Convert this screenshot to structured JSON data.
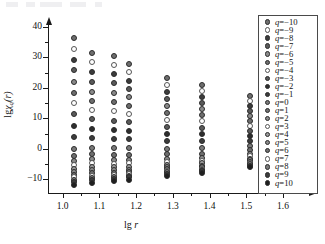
{
  "figure": {
    "background": "#ffffff",
    "axis_color": "#1a1a1a"
  },
  "chart_data": {
    "type": "scatter",
    "title": "",
    "xlabel": "lg r",
    "ylabel": "lg χq(r)",
    "xlabel_parts": {
      "lg": "lg",
      "var": "r"
    },
    "ylabel_parts": {
      "lg": "lg",
      "chi": "χ",
      "sub": "q",
      "arg": "(r)"
    },
    "xlim": [
      0.96,
      1.66
    ],
    "ylim": [
      -14.5,
      41
    ],
    "xticks": [
      1.0,
      1.1,
      1.2,
      1.3,
      1.4,
      1.5,
      1.6
    ],
    "xticklabels": [
      "1.0",
      "1.1",
      "1.2",
      "1.3",
      "1.4",
      "1.5",
      "1.6"
    ],
    "xminorticks": [
      1.05,
      1.15,
      1.25,
      1.35,
      1.45,
      1.55
    ],
    "yticks": [
      -10,
      0,
      10,
      20,
      30,
      40
    ],
    "yticklabels": [
      "−10",
      "0",
      "10",
      "20",
      "30",
      "40"
    ],
    "yminorticks": [
      -5,
      5,
      15,
      25,
      35
    ],
    "grid": false,
    "legend_position": "right-inside",
    "x": [
      1.03,
      1.08,
      1.14,
      1.18,
      1.285,
      1.38,
      1.51
    ],
    "series": [
      {
        "name": "q=-10",
        "q": -10,
        "marker": "filled",
        "color": "#6e6e6e",
        "values": [
          36.5,
          31.6,
          30.5,
          28.0,
          23.3,
          21.1,
          17.2
        ]
      },
      {
        "name": "q=-9",
        "q": -9,
        "marker": "open",
        "color": "#ffffff",
        "values": [
          32.7,
          28.5,
          27.5,
          25.1,
          20.9,
          19.0,
          15.6
        ]
      },
      {
        "name": "q=-8",
        "q": -8,
        "marker": "filled",
        "color": "#3c3c3c",
        "values": [
          29.2,
          25.2,
          24.5,
          22.3,
          18.6,
          17.1,
          14.0
        ]
      },
      {
        "name": "q=-7",
        "q": -7,
        "marker": "filled",
        "color": "#5a5a5a",
        "values": [
          25.8,
          22.0,
          21.5,
          19.6,
          16.4,
          15.1,
          12.4
        ]
      },
      {
        "name": "q=-6",
        "q": -6,
        "marker": "filled",
        "color": "#8a8a8a",
        "values": [
          21.9,
          18.8,
          18.4,
          16.9,
          14.1,
          13.1,
          10.8
        ]
      },
      {
        "name": "q=-5",
        "q": -5,
        "marker": "filled",
        "color": "#6e6e6e",
        "values": [
          18.4,
          15.7,
          15.4,
          14.2,
          11.9,
          11.1,
          9.2
        ]
      },
      {
        "name": "q=-4",
        "q": -4,
        "marker": "open",
        "color": "#ffffff",
        "values": [
          14.9,
          12.9,
          12.3,
          11.5,
          9.5,
          9.0,
          7.6
        ]
      },
      {
        "name": "q=-3",
        "q": -3,
        "marker": "filled",
        "color": "#5a5a5a",
        "values": [
          11.3,
          9.7,
          9.2,
          8.7,
          7.2,
          6.9,
          5.9
        ]
      },
      {
        "name": "q=-2",
        "q": -2,
        "marker": "filled",
        "color": "#2e2e2e",
        "values": [
          7.6,
          6.6,
          6.2,
          5.9,
          5.0,
          4.8,
          4.3
        ]
      },
      {
        "name": "q=-1",
        "q": -1,
        "marker": "filled",
        "color": "#3c3c3c",
        "values": [
          3.9,
          3.7,
          3.2,
          3.1,
          2.6,
          2.5,
          2.6
        ]
      },
      {
        "name": "q=0",
        "q": 0,
        "marker": "filled",
        "color": "#7a7a7a",
        "values": [
          0.1,
          0.4,
          0.2,
          0.2,
          0.1,
          0.2,
          0.9
        ]
      },
      {
        "name": "q=1",
        "q": 1,
        "marker": "filled",
        "color": "#6e6e6e",
        "values": [
          -2.2,
          -1.8,
          -2.1,
          -2.0,
          -1.8,
          -1.6,
          -0.5
        ]
      },
      {
        "name": "q=2",
        "q": 2,
        "marker": "filled",
        "color": "#8a8a8a",
        "values": [
          -3.9,
          -3.4,
          -3.6,
          -3.5,
          -3.2,
          -2.9,
          -1.6
        ]
      },
      {
        "name": "q=3",
        "q": 3,
        "marker": "open",
        "color": "#ffffff",
        "values": [
          -5.3,
          -4.8,
          -4.9,
          -4.8,
          -4.3,
          -3.9,
          -2.5
        ]
      },
      {
        "name": "q=4",
        "q": 4,
        "marker": "filled",
        "color": "#9a9a9a",
        "values": [
          -6.5,
          -6.0,
          -6.0,
          -5.9,
          -5.2,
          -4.8,
          -3.2
        ]
      },
      {
        "name": "q=5",
        "q": 5,
        "marker": "filled",
        "color": "#8a8a8a",
        "values": [
          -7.6,
          -7.1,
          -7.0,
          -6.8,
          -6.0,
          -5.5,
          -3.8
        ]
      },
      {
        "name": "q=6",
        "q": 6,
        "marker": "filled",
        "color": "#6e6e6e",
        "values": [
          -8.5,
          -8.0,
          -7.9,
          -7.6,
          -6.6,
          -6.1,
          -4.3
        ]
      },
      {
        "name": "q=7",
        "q": 7,
        "marker": "open",
        "color": "#ffffff",
        "values": [
          -9.3,
          -8.8,
          -8.6,
          -8.3,
          -7.2,
          -6.6,
          -4.8
        ]
      },
      {
        "name": "q=8",
        "q": 8,
        "marker": "filled",
        "color": "#7a7a7a",
        "values": [
          -10.1,
          -9.5,
          -9.3,
          -8.9,
          -7.7,
          -7.0,
          -5.1
        ]
      },
      {
        "name": "q=9",
        "q": 9,
        "marker": "filled",
        "color": "#3c3c3c",
        "values": [
          -10.8,
          -10.1,
          -9.9,
          -9.4,
          -8.1,
          -7.4,
          -5.5
        ]
      },
      {
        "name": "q=10",
        "q": 10,
        "marker": "filled",
        "color": "#1f1f1f",
        "values": [
          -11.9,
          -11.2,
          -10.7,
          -10.2,
          -8.9,
          -7.9,
          -5.8
        ]
      }
    ],
    "legend": [
      {
        "label": "q=−10",
        "marker": "filled",
        "color": "#6e6e6e"
      },
      {
        "label": "q=−9",
        "marker": "open",
        "color": "#ffffff"
      },
      {
        "label": "q=−8",
        "marker": "filled",
        "color": "#3c3c3c"
      },
      {
        "label": "q=−7",
        "marker": "filled",
        "color": "#5a5a5a"
      },
      {
        "label": "q=−6",
        "marker": "filled",
        "color": "#8a8a8a"
      },
      {
        "label": "q=−5",
        "marker": "filled",
        "color": "#6e6e6e"
      },
      {
        "label": "q=−4",
        "marker": "open",
        "color": "#ffffff"
      },
      {
        "label": "q=−3",
        "marker": "filled",
        "color": "#5a5a5a"
      },
      {
        "label": "q=−2",
        "marker": "filled",
        "color": "#2e2e2e"
      },
      {
        "label": "q=−1",
        "marker": "filled",
        "color": "#3c3c3c"
      },
      {
        "label": "q=0",
        "marker": "filled",
        "color": "#7a7a7a"
      },
      {
        "label": "q=1",
        "marker": "filled",
        "color": "#6e6e6e"
      },
      {
        "label": "q=2",
        "marker": "filled",
        "color": "#8a8a8a"
      },
      {
        "label": "q=3",
        "marker": "open",
        "color": "#ffffff"
      },
      {
        "label": "q=4",
        "marker": "filled",
        "color": "#9a9a9a"
      },
      {
        "label": "q=5",
        "marker": "filled",
        "color": "#8a8a8a"
      },
      {
        "label": "q=6",
        "marker": "filled",
        "color": "#6e6e6e"
      },
      {
        "label": "q=7",
        "marker": "open",
        "color": "#ffffff"
      },
      {
        "label": "q=8",
        "marker": "filled",
        "color": "#7a7a7a"
      },
      {
        "label": "q=9",
        "marker": "filled",
        "color": "#3c3c3c"
      },
      {
        "label": "q=10",
        "marker": "filled",
        "color": "#1f1f1f"
      }
    ]
  }
}
